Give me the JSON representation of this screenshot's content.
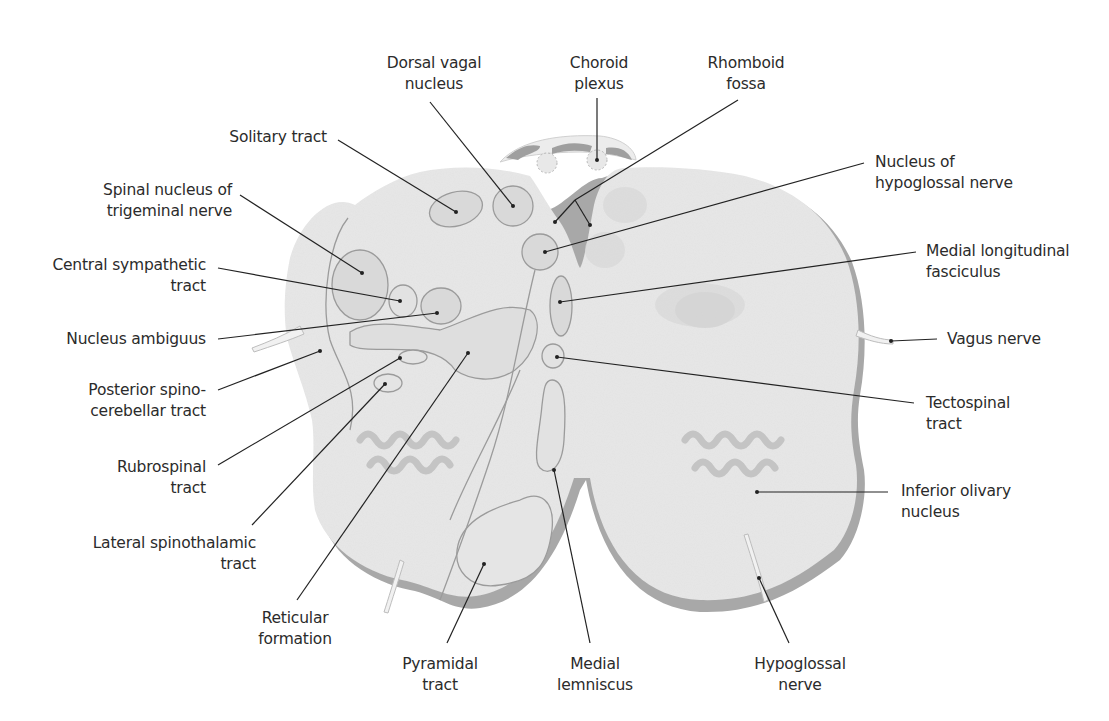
{
  "figure": {
    "colors": {
      "tissue": "#e6e6e6",
      "tissue_shadow": "#a9a9a9",
      "nucleus_fill": "#d6d6d6",
      "outline": "#9a9a9a",
      "leader_line": "#222222",
      "text": "#2b2b2b"
    }
  },
  "labels": {
    "dorsal_vagal_nucleus": "Dorsal vagal\nnucleus",
    "choroid_plexus": "Choroid\nplexus",
    "rhomboid_fossa": "Rhomboid\nfossa",
    "solitary_tract": "Solitary tract",
    "spinal_nucleus_trigeminal": "Spinal nucleus of\ntrigeminal nerve",
    "central_sympathetic_tract": "Central sympathetic\ntract",
    "nucleus_ambiguus": "Nucleus ambiguus",
    "posterior_spinocerebellar": "Posterior spino-\ncerebellar tract",
    "rubrospinal_tract": "Rubrospinal\ntract",
    "lateral_spinothalamic": "Lateral spinothalamic\ntract",
    "reticular_formation": "Reticular\nformation",
    "pyramidal_tract": "Pyramidal\ntract",
    "medial_lemniscus": "Medial\nlemniscus",
    "hypoglossal_nerve": "Hypoglossal\nnerve",
    "inferior_olivary_nucleus": "Inferior olivary\nnucleus",
    "tectospinal_tract": "Tectospinal\ntract",
    "vagus_nerve": "Vagus nerve",
    "medial_longitudinal_fasciculus": "Medial longitudinal\nfasciculus",
    "nucleus_hypoglossal_nerve": "Nucleus of\nhypoglossal nerve"
  }
}
